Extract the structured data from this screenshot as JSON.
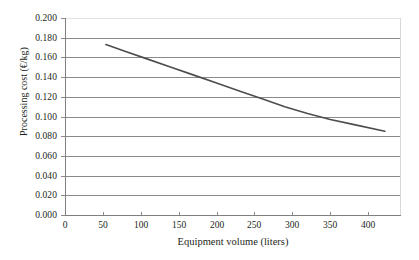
{
  "chart_data": {
    "type": "line",
    "title": "",
    "xlabel": "Equipment volume (liters)",
    "ylabel": "Processing cost (€/kg)",
    "xlim": [
      0,
      442
    ],
    "ylim": [
      0.0,
      0.2
    ],
    "grid": true,
    "legend": "none",
    "x_ticks": [
      0,
      50,
      100,
      150,
      200,
      250,
      300,
      350,
      400
    ],
    "x_tick_labels": [
      "0",
      "50",
      "100",
      "150",
      "200",
      "250",
      "300",
      "350",
      "400"
    ],
    "y_ticks": [
      0.0,
      0.02,
      0.04,
      0.06,
      0.08,
      0.1,
      0.12,
      0.14,
      0.16,
      0.18,
      0.2
    ],
    "y_tick_labels": [
      "0.000",
      "0.020",
      "0.040",
      "0.060",
      "0.080",
      "0.100",
      "0.120",
      "0.140",
      "0.160",
      "0.180",
      "0.200"
    ],
    "series": [
      {
        "name": "Processing cost",
        "color": "#4d4d4d",
        "line_width": 1.6,
        "x": [
          54,
          80,
          110,
          140,
          170,
          200,
          230,
          260,
          290,
          320,
          350,
          380,
          422
        ],
        "y": [
          0.173,
          0.166,
          0.158,
          0.15,
          0.142,
          0.134,
          0.126,
          0.118,
          0.11,
          0.103,
          0.097,
          0.092,
          0.085
        ]
      }
    ]
  },
  "axis_style": {
    "grid_color": "#8a8a8a",
    "axis_color": "#7f7f7f",
    "text_color": "#231f20",
    "background": "#ffffff"
  }
}
